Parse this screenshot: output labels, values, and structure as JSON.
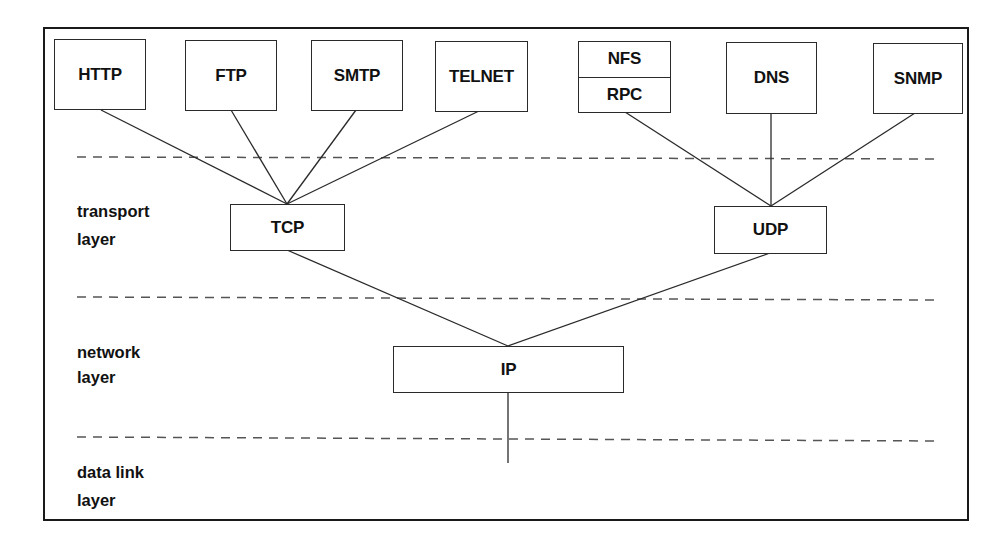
{
  "diagram": {
    "title": "",
    "application_protocols": [
      {
        "id": "http",
        "label": "HTTP",
        "transport": "TCP"
      },
      {
        "id": "ftp",
        "label": "FTP",
        "transport": "TCP"
      },
      {
        "id": "smtp",
        "label": "SMTP",
        "transport": "TCP"
      },
      {
        "id": "telnet",
        "label": "TELNET",
        "transport": "TCP"
      },
      {
        "id": "nfs-rpc",
        "label_top": "NFS",
        "label_bottom": "RPC",
        "transport": "UDP"
      },
      {
        "id": "dns",
        "label": "DNS",
        "transport": "UDP"
      },
      {
        "id": "snmp",
        "label": "SNMP",
        "transport": "UDP"
      }
    ],
    "transport_protocols": [
      {
        "id": "tcp",
        "label": "TCP",
        "network": "IP"
      },
      {
        "id": "udp",
        "label": "UDP",
        "network": "IP"
      }
    ],
    "network_protocols": [
      {
        "id": "ip",
        "label": "IP"
      }
    ],
    "layers": {
      "transport": "transport\nlayer",
      "network": "network\nlayer",
      "data_link": "data link\nlayer"
    },
    "edges": [
      [
        "HTTP",
        "TCP"
      ],
      [
        "FTP",
        "TCP"
      ],
      [
        "SMTP",
        "TCP"
      ],
      [
        "TELNET",
        "TCP"
      ],
      [
        "NFS/RPC",
        "UDP"
      ],
      [
        "DNS",
        "UDP"
      ],
      [
        "SNMP",
        "UDP"
      ],
      [
        "TCP",
        "IP"
      ],
      [
        "UDP",
        "IP"
      ],
      [
        "IP",
        "data link layer"
      ]
    ],
    "colors": {
      "line": "#2a2a2a",
      "dash": "#555555",
      "background": "#ffffff"
    }
  }
}
